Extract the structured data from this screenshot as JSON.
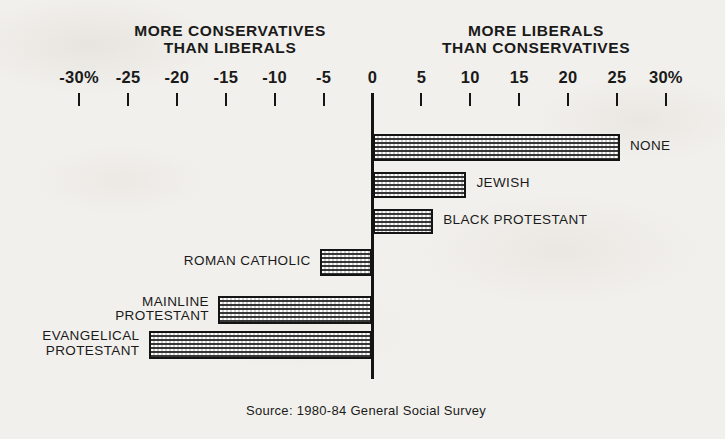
{
  "chart_data": {
    "type": "bar",
    "orientation": "horizontal",
    "title": "",
    "headers": {
      "left": {
        "line1": "MORE CONSERVATIVES",
        "line2": "THAN LIBERALS"
      },
      "right": {
        "line1": "MORE LIBERALS",
        "line2": "THAN CONSERVATIVES"
      }
    },
    "xlabel": "",
    "ylabel": "",
    "xlim": [
      -30,
      30
    ],
    "grid": false,
    "legend": "none",
    "axis_tick_labels": [
      "-30%",
      "-25",
      "-20",
      "-15",
      "-10",
      "-5",
      "0",
      "5",
      "10",
      "15",
      "20",
      "25",
      "30%"
    ],
    "axis_tick_values": [
      -30,
      -25,
      -20,
      -15,
      -10,
      -5,
      0,
      5,
      10,
      15,
      20,
      25,
      30
    ],
    "categories": [
      "NONE",
      "JEWISH",
      "BLACK PROTESTANT",
      "ROMAN CATHOLIC",
      "MAINLINE PROTESTANT",
      "EVANGELICAL PROTESTANT"
    ],
    "values": [
      25.3,
      9.6,
      6.2,
      -5.4,
      -15.8,
      -22.9
    ],
    "bars": [
      {
        "label": "NONE",
        "label_lines": [
          "NONE"
        ],
        "value": 25.3,
        "side": "right"
      },
      {
        "label": "JEWISH",
        "label_lines": [
          "JEWISH"
        ],
        "value": 9.6,
        "side": "right"
      },
      {
        "label": "BLACK PROTESTANT",
        "label_lines": [
          "BLACK PROTESTANT"
        ],
        "value": 6.2,
        "side": "right"
      },
      {
        "label": "ROMAN CATHOLIC",
        "label_lines": [
          "ROMAN CATHOLIC"
        ],
        "value": -5.4,
        "side": "left"
      },
      {
        "label": "MAINLINE PROTESTANT",
        "label_lines": [
          "MAINLINE",
          "PROTESTANT"
        ],
        "value": -15.8,
        "side": "left"
      },
      {
        "label": "EVANGELICAL PROTESTANT",
        "label_lines": [
          "EVANGELICAL",
          "PROTESTANT"
        ],
        "value": -22.9,
        "side": "left"
      }
    ],
    "source": "Source: 1980-84 General Social Survey",
    "colors": {
      "ink": "#141414",
      "paper": "#f2f0ec",
      "bar_fill": "#cfcfcf"
    }
  }
}
